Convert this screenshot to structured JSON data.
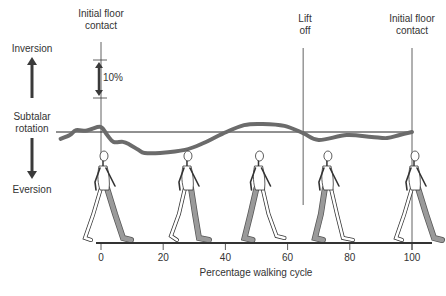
{
  "labels": {
    "inversion": "Inversion",
    "subtalar_line1": "Subtalar",
    "subtalar_line2": "rotation",
    "eversion": "Eversion",
    "scale_bar": "10%",
    "events": [
      {
        "line1": "Initial floor",
        "line2": "contact",
        "pct": 0
      },
      {
        "line1": "Lift",
        "line2": "off",
        "pct": 65
      },
      {
        "line1": "Initial floor",
        "line2": "contact",
        "pct": 100
      }
    ]
  },
  "chart_data": {
    "type": "line",
    "title": "",
    "xlabel": "Percentage walking cycle",
    "ylabel": "Subtalar rotation",
    "y_positive_label": "Inversion",
    "y_negative_label": "Eversion",
    "scale_bar": "10%",
    "xlim": [
      -15,
      105
    ],
    "xticks": [
      0,
      20,
      40,
      60,
      80,
      100
    ],
    "xtick_labels": [
      "0",
      "20",
      "40",
      "60",
      "80",
      "100"
    ],
    "series": [
      {
        "name": "Subtalar rotation",
        "x": [
          -13,
          -10,
          -8,
          -5,
          -3,
          0,
          2,
          4,
          7,
          9,
          12,
          14,
          19,
          27,
          33,
          39,
          46,
          52,
          59,
          65,
          70,
          79,
          87,
          92,
          96,
          100
        ],
        "y": [
          -1.8,
          -0.8,
          0.5,
          0.3,
          0.8,
          1.3,
          -0.8,
          -2.6,
          -2.6,
          -3.2,
          -4.7,
          -5.5,
          -5.5,
          -4.7,
          -2.9,
          -0.5,
          1.8,
          2.1,
          1.6,
          -0.3,
          -2.1,
          -0.8,
          -1.3,
          -1.6,
          -0.8,
          0
        ]
      }
    ],
    "events": [
      {
        "label": "Initial floor contact",
        "x": 0
      },
      {
        "label": "Lift off",
        "x": 65
      },
      {
        "label": "Initial floor contact",
        "x": 100
      }
    ],
    "figures_at": [
      0,
      27,
      50,
      72,
      100
    ],
    "grid": false,
    "colors": {
      "curve": "#6b6b6b",
      "lines": "#3a3a3a",
      "leg_shade": "#9a9a9a"
    }
  }
}
